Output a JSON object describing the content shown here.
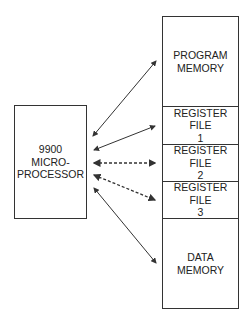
{
  "diagram": {
    "processor": {
      "lines": [
        "9900",
        "MICRO-",
        "PROCESSOR"
      ]
    },
    "memory_blocks": [
      {
        "id": "program-memory",
        "lines": [
          "PROGRAM",
          "MEMORY"
        ],
        "connection": "solid"
      },
      {
        "id": "register-file-1",
        "lines": [
          "REGISTER",
          "FILE",
          "1"
        ],
        "connection": "solid"
      },
      {
        "id": "register-file-2",
        "lines": [
          "REGISTER",
          "FILE",
          "2"
        ],
        "connection": "dashed"
      },
      {
        "id": "register-file-3",
        "lines": [
          "REGISTER",
          "FILE",
          "3"
        ],
        "connection": "dashed"
      },
      {
        "id": "data-memory",
        "lines": [
          "DATA",
          "MEMORY"
        ],
        "connection": "solid"
      }
    ],
    "colors": {
      "stroke": "#333333",
      "background": "#ffffff"
    }
  }
}
